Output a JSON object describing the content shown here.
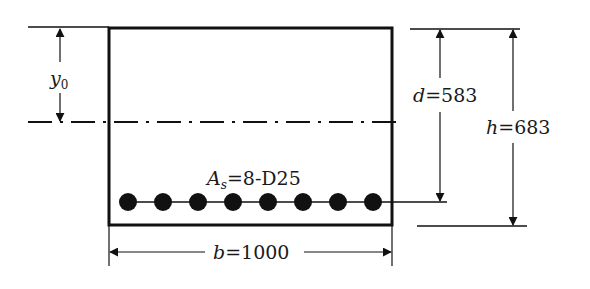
{
  "diagram": {
    "type": "reinforced-concrete-section",
    "labels": {
      "y0": {
        "var": "y",
        "sub": "0"
      },
      "d": {
        "var": "d",
        "eq": "=",
        "value": "583"
      },
      "h": {
        "var": "h",
        "eq": "=",
        "value": "683"
      },
      "b": {
        "var": "b",
        "eq": "=",
        "value": "1000"
      },
      "As": {
        "var": "A",
        "sub": "s",
        "eq": "=",
        "value": "8-D25"
      }
    },
    "rebar": {
      "count": 8,
      "designation": "D25"
    },
    "colors": {
      "line": "#111111",
      "background": "#ffffff"
    }
  }
}
